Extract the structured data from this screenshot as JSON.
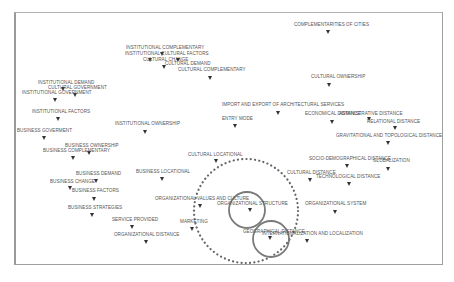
{
  "diagram": {
    "type": "perceptual-map",
    "frame": {
      "x": 14,
      "y": 12,
      "w": 429,
      "h": 253
    },
    "nodes": [
      {
        "label": "COMPLEMENTARITIES OF CITIES",
        "lx": 294,
        "ly": 22,
        "mx": 328,
        "my": 30
      },
      {
        "label": "INSTITUTIONAL COMPLEMENTARY",
        "lx": 126,
        "ly": 45,
        "mx": 162,
        "my": 52
      },
      {
        "label": "INSTITUTIONAL CULTURAL FACTORS",
        "lx": 125,
        "ly": 51,
        "mx": 150,
        "my": 58
      },
      {
        "label": "CULTURAL CHANGE",
        "lx": 143,
        "ly": 57,
        "mx": 178,
        "my": 58
      },
      {
        "label": "CULTURAL DEMAND",
        "lx": 165,
        "ly": 61,
        "mx": 164,
        "my": 65
      },
      {
        "label": "CULTURAL COMPLEMENTARY",
        "lx": 178,
        "ly": 67,
        "mx": 210,
        "my": 76
      },
      {
        "label": "INSTITUTIONAL DEMAND",
        "lx": 38,
        "ly": 80,
        "mx": 63,
        "my": 87
      },
      {
        "label": "CULTURAL GOVERNMENT",
        "lx": 48,
        "ly": 85,
        "mx": 75,
        "my": 93
      },
      {
        "label": "INSTITUTIONAL GOVERNMENT",
        "lx": 22,
        "ly": 90,
        "mx": 55,
        "my": 98
      },
      {
        "label": "CULTURAL OWNERSHIP",
        "lx": 311,
        "ly": 74,
        "mx": 329,
        "my": 83
      },
      {
        "label": "INSTITUTIONAL FACTORS",
        "lx": 32,
        "ly": 109,
        "mx": 58,
        "my": 117
      },
      {
        "label": "IMPORT AND EXPORT OF ARCHITECTURAL SERVICES",
        "lx": 222,
        "ly": 102,
        "mx": 278,
        "my": 111
      },
      {
        "label": "ENTRY MODE",
        "lx": 222,
        "ly": 116,
        "mx": 235,
        "my": 124
      },
      {
        "label": "ECONOMICAL DISTANCE",
        "lx": 305,
        "ly": 111,
        "mx": 332,
        "my": 120
      },
      {
        "label": "ADMINISTRATIVE DISTANCE",
        "lx": 339,
        "ly": 111,
        "mx": 369,
        "my": 117
      },
      {
        "label": "RELATIONAL DISTANCE",
        "lx": 367,
        "ly": 119,
        "mx": 395,
        "my": 126
      },
      {
        "label": "INSTITUTIONAL OWNERSHIP",
        "lx": 115,
        "ly": 121,
        "mx": 145,
        "my": 130
      },
      {
        "label": "BUSINESS GOVERMENT",
        "lx": 17,
        "ly": 128,
        "mx": 44,
        "my": 136
      },
      {
        "label": "GRAVITATIONAL AND TOPOLOGICAL DISTANCE",
        "lx": 336,
        "ly": 133,
        "mx": 388,
        "my": 141
      },
      {
        "label": "BUSINESS OWNERSHIP",
        "lx": 65,
        "ly": 143,
        "mx": 89,
        "my": 151
      },
      {
        "label": "BUSINESS COMPLEMENTARY",
        "lx": 43,
        "ly": 148,
        "mx": 73,
        "my": 156
      },
      {
        "label": "CULTURAL LOCATIONAL",
        "lx": 188,
        "ly": 152,
        "mx": 216,
        "my": 159
      },
      {
        "label": "SOCIO-DEMOGRAPHICAL DISTANCE",
        "lx": 309,
        "ly": 156,
        "mx": 347,
        "my": 164
      },
      {
        "label": "GLOBALIZATION",
        "lx": 373,
        "ly": 158,
        "mx": 388,
        "my": 167
      },
      {
        "label": "BUSINESS DEMAND",
        "lx": 76,
        "ly": 171,
        "mx": 96,
        "my": 179
      },
      {
        "label": "BUSINESS LOCATIONAL",
        "lx": 136,
        "ly": 169,
        "mx": 162,
        "my": 177
      },
      {
        "label": "CULTURAL DISTANCE",
        "lx": 287,
        "ly": 170,
        "mx": 310,
        "my": 178
      },
      {
        "label": "TECHNOLOGICAL DISTANCE",
        "lx": 316,
        "ly": 174,
        "mx": 349,
        "my": 182
      },
      {
        "label": "BUSINESS CHANGE",
        "lx": 50,
        "ly": 179,
        "mx": 70,
        "my": 186
      },
      {
        "label": "BUSINESS FACTORS",
        "lx": 72,
        "ly": 188,
        "mx": 94,
        "my": 197
      },
      {
        "label": "ORGANIZATIONAL VALUES AND CULTURE",
        "lx": 155,
        "ly": 196,
        "mx": 200,
        "my": 204
      },
      {
        "label": "ORGANIZATIONAL STRUCTURE",
        "lx": 217,
        "ly": 201,
        "mx": 250,
        "my": 208
      },
      {
        "label": "ORGANIZATIONAL SYSTEM",
        "lx": 305,
        "ly": 201,
        "mx": 335,
        "my": 210
      },
      {
        "label": "BUSINESS STRATEGIES",
        "lx": 68,
        "ly": 205,
        "mx": 92,
        "my": 213
      },
      {
        "label": "SERVICE PROVIDED",
        "lx": 112,
        "ly": 217,
        "mx": 132,
        "my": 225
      },
      {
        "label": "MARKETING",
        "lx": 180,
        "ly": 219,
        "mx": 192,
        "my": 227
      },
      {
        "label": "GEOGRAPHICAL DISTANCE",
        "lx": 243,
        "ly": 229,
        "mx": 270,
        "my": 236
      },
      {
        "label": "INTERNATIONALIZATION AND LOCALIZATION",
        "lx": 262,
        "ly": 231,
        "mx": 307,
        "my": 239
      },
      {
        "label": "ORGANIZATIONAL DISTANCE",
        "lx": 114,
        "ly": 232,
        "mx": 146,
        "my": 240
      }
    ],
    "highlights": [
      {
        "shape": "dotted-circle",
        "cx": 246,
        "cy": 211,
        "r": 52,
        "color": "#666666"
      },
      {
        "shape": "circle",
        "cx": 247,
        "cy": 210,
        "r": 18,
        "color": "#7a7a7a"
      },
      {
        "shape": "circle",
        "cx": 271,
        "cy": 239,
        "r": 18,
        "color": "#7a7a7a"
      }
    ]
  }
}
